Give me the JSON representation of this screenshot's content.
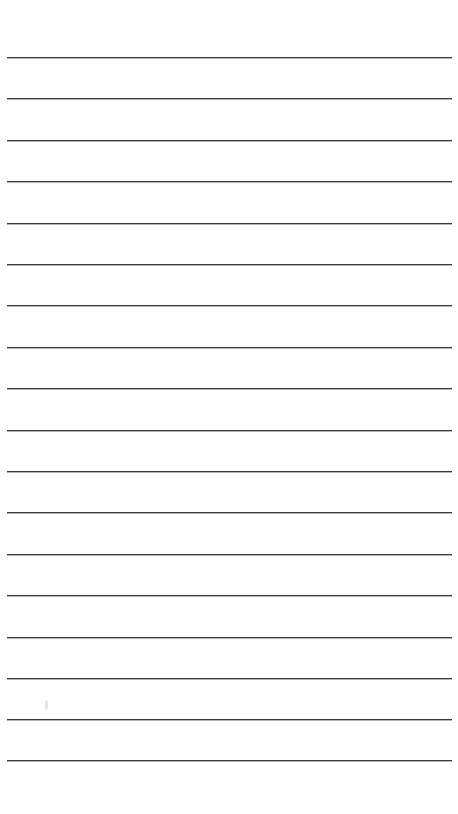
{
  "document": {
    "kind": "ruled-notebook-page",
    "title": "Blank Lined Paper",
    "background_color": "#ffffff",
    "page_width": 458,
    "page_height": 814,
    "text_content": "",
    "is_blank": true
  },
  "ruling": {
    "line_color": "#3b3b3b",
    "line_thickness_px": 1.6,
    "line_count": 18,
    "line_left_x": 7,
    "line_right_x": 452,
    "line_length_px": 445,
    "first_line_y": 57,
    "last_line_y": 760,
    "line_spacing_px": 41.4,
    "top_margin_px": 57,
    "bottom_margin_px": 54,
    "left_margin_px": 7,
    "right_margin_px": 6,
    "lines_y": [
      57,
      98,
      140,
      181,
      223,
      264,
      305,
      347,
      388,
      430,
      471,
      512,
      554,
      595,
      637,
      678,
      719,
      760
    ]
  },
  "marks": [
    {
      "name": "faint-smudge",
      "x": 45,
      "y": 700,
      "color": "#aaaaaf"
    }
  ]
}
